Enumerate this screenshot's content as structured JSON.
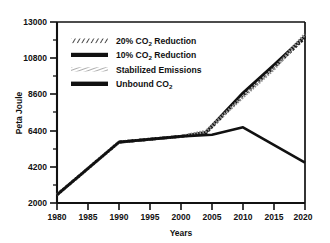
{
  "chart_data": {
    "type": "line",
    "title": "",
    "xlabel": "Years",
    "ylabel": "Peta Joule",
    "xlim": [
      1980,
      2020
    ],
    "ylim": [
      2000,
      13000
    ],
    "xticks": [
      1980,
      1985,
      1990,
      1995,
      2000,
      2005,
      2010,
      2015,
      2020
    ],
    "yticks": [
      2000,
      4200,
      6400,
      8600,
      10800,
      13000
    ],
    "ytick_step": 2200,
    "grid": false,
    "legend_position": "upper-left-inside",
    "series": [
      {
        "name": "20% CO2 Reduction",
        "label": "20% CO",
        "label_sub": "2",
        "label_tail": " Reduction",
        "style": "hatched",
        "color": "#1a1a1a",
        "x": [
          1980,
          1990,
          2000,
          2004,
          2010,
          2015,
          2020
        ],
        "y": [
          2500,
          5700,
          6050,
          6250,
          8550,
          10250,
          12050
        ]
      },
      {
        "name": "10% CO2 Reduction",
        "label": "10% CO",
        "label_sub": "2",
        "label_tail": " Reduction",
        "style": "solid",
        "color": "#111111",
        "x": [
          1980,
          1990,
          2000,
          2004,
          2010,
          2015,
          2020
        ],
        "y": [
          2500,
          5700,
          6050,
          6300,
          8700,
          10400,
          12150
        ]
      },
      {
        "name": "Stabilized Emissions",
        "label": "Stabilized Emissions",
        "label_sub": "",
        "label_tail": "",
        "style": "dotted",
        "color": "#8a8a8a",
        "x": [
          1980,
          1990,
          2000,
          2004,
          2010,
          2015,
          2020
        ],
        "y": [
          2500,
          5700,
          6050,
          6350,
          8450,
          10150,
          12250
        ]
      },
      {
        "name": "Unbound CO2",
        "label": "Unbound CO",
        "label_sub": "2",
        "label_tail": "",
        "style": "solid",
        "color": "#111111",
        "x": [
          1980,
          1990,
          2000,
          2005,
          2010,
          2020
        ],
        "y": [
          2500,
          5700,
          6050,
          6150,
          6600,
          4450
        ]
      }
    ]
  },
  "axes": {
    "ylabel": "Peta Joule",
    "xlabel": "Years",
    "ytick_labels": [
      "13000",
      "10800",
      "8600",
      "6400",
      "4200",
      "2000"
    ],
    "xtick_labels": [
      "1980",
      "1985",
      "1990",
      "1995",
      "2000",
      "2005",
      "2010",
      "2015",
      "2020"
    ]
  },
  "legend": {
    "items": [
      {
        "label": "20% CO",
        "sub": "2",
        "tail": " Reduction",
        "swatch": "hatched"
      },
      {
        "label": "10% CO",
        "sub": "2",
        "tail": " Reduction",
        "swatch": "solid"
      },
      {
        "label": "Stabilized Emissions",
        "sub": "",
        "tail": "",
        "swatch": "dotted"
      },
      {
        "label": "Unbound CO",
        "sub": "2",
        "tail": "",
        "swatch": "solid"
      }
    ]
  },
  "colors": {
    "axis": "#111111",
    "line_dark": "#111111",
    "line_gray": "#8a8a8a",
    "background": "#ffffff"
  }
}
